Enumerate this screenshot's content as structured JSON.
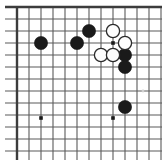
{
  "diagram": {
    "kind": "go-board-diagram",
    "background_color": "#ffffff",
    "line_color": "#5a5a5a",
    "border_color": "#3c3c3c",
    "black_color": "#1a1a1a",
    "white_fill": "#fdfdfd",
    "white_stroke": "#2b2b2b"
  },
  "board": {
    "origin_x": 17,
    "origin_y": 7,
    "spacing": 12,
    "cols": 12,
    "rows": 12,
    "border_top": true,
    "border_left": true,
    "border_right": false,
    "border_bottom": false,
    "stone_radius": 6.6
  },
  "star_points": [
    {
      "name": "star-point-left",
      "x": 41,
      "y": 118
    },
    {
      "name": "star-point-center",
      "x": 113,
      "y": 118
    },
    {
      "name": "star-point-upper",
      "x": 113,
      "y": 43
    }
  ],
  "faint_marks": [
    {
      "name": "faint-mark-right",
      "x": 143,
      "y": 91
    }
  ],
  "stones": [
    {
      "name": "black-stone-1",
      "color": "black",
      "x": 41,
      "y": 43
    },
    {
      "name": "black-stone-2",
      "color": "black",
      "x": 77,
      "y": 43
    },
    {
      "name": "black-stone-3",
      "color": "black",
      "x": 89,
      "y": 31
    },
    {
      "name": "black-stone-4",
      "color": "black",
      "x": 125,
      "y": 55
    },
    {
      "name": "black-stone-5",
      "color": "black",
      "x": 125,
      "y": 67
    },
    {
      "name": "black-stone-6",
      "color": "black",
      "x": 125,
      "y": 107
    },
    {
      "name": "white-stone-1",
      "color": "white",
      "x": 113,
      "y": 31
    },
    {
      "name": "white-stone-2",
      "color": "white",
      "x": 125,
      "y": 43
    },
    {
      "name": "white-stone-3",
      "color": "white",
      "x": 101,
      "y": 55
    },
    {
      "name": "white-stone-4",
      "color": "white",
      "x": 113,
      "y": 55
    }
  ]
}
